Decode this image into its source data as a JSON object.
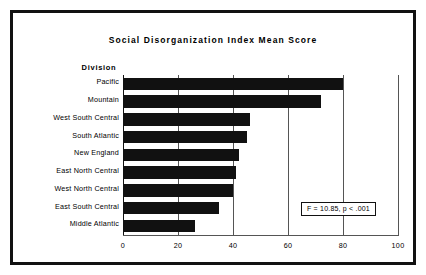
{
  "chart_data": {
    "type": "bar",
    "orientation": "horizontal",
    "title": "Social Disorganization Index Mean Score",
    "xlabel": "",
    "ylabel": "Division",
    "xlim": [
      0,
      100
    ],
    "xticks": [
      "0",
      "20",
      "40",
      "60",
      "80",
      "100"
    ],
    "xtick_values": [
      0,
      20,
      40,
      60,
      80,
      100
    ],
    "grid": "vertical",
    "legend": "none",
    "bar_color": "#111111",
    "categories": [
      "Pacific",
      "Mountain",
      "West South Central",
      "South Atlantic",
      "New England",
      "East North Central",
      "West North Central",
      "East South Central",
      "Middle Atlantic"
    ],
    "values": [
      80,
      72,
      46,
      45,
      42,
      41,
      40,
      35,
      26
    ],
    "annotations": [
      {
        "text": "F = 10.85, p < .001",
        "x": 70,
        "y": 1.2
      }
    ]
  },
  "figure": {
    "title": "Social Disorganization Index Mean Score",
    "axis_header": "Division",
    "annotation": "F = 10.85, p < .001"
  }
}
